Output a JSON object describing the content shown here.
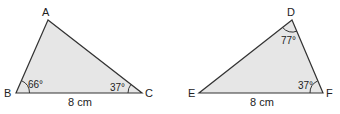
{
  "triangle1": {
    "vertices": {
      "A": "A",
      "B": "B",
      "C": "C"
    },
    "angle_B": "66°",
    "angle_C": "37°",
    "side_BC": "8 cm"
  },
  "triangle2": {
    "vertices": {
      "D": "D",
      "E": "E",
      "F": "F"
    },
    "angle_D": "77°",
    "angle_F": "37°",
    "side_EF": "8 cm"
  },
  "colors": {
    "fill": "#e6e6e6",
    "stroke": "#333333"
  }
}
